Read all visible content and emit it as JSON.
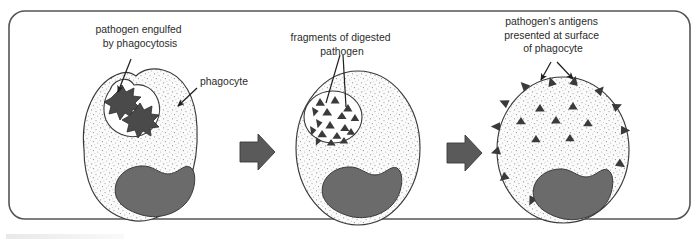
{
  "figure": {
    "title_alt": "Phagocytosis and antigen presentation by a phagocyte",
    "frame": {
      "border_color": "#555555",
      "background_color": "#ffffff",
      "corner_radius": 16
    },
    "colors": {
      "outline": "#3a3a3a",
      "cytoplasm_fill": "#fbfbfb",
      "stipple_dot": "#8f8f8f",
      "nucleus_fill": "#6b6b6b",
      "nucleus_stroke": "#3a3a3a",
      "pathogen_fill": "#4a4a4a",
      "antigen_fill": "#3a3a3a",
      "arrow_fill": "#5a5a5a",
      "leader_line": "#1f1f1f",
      "label_text": "#2b2b2b"
    },
    "labels": [
      {
        "id": "label-stage-1",
        "name": "pathogen-engulfed-label",
        "lines": [
          "pathogen engulfed",
          "by phagocytosis"
        ],
        "x": 140,
        "y": 33,
        "anchor": "middle"
      },
      {
        "id": "label-phagocyte",
        "name": "phagocyte-label",
        "lines": [
          "phagocyte"
        ],
        "x": 200,
        "y": 85,
        "anchor": "start"
      },
      {
        "id": "label-stage-2",
        "name": "fragments-of-digested-pathogen-label",
        "lines": [
          "fragments of digested",
          "pathogen"
        ],
        "x": 342,
        "y": 41,
        "anchor": "middle"
      },
      {
        "id": "label-stage-3",
        "name": "pathogens-antigens-label",
        "lines": [
          "pathogen's antigens",
          "presented at surface",
          "of phagocyte"
        ],
        "x": 553,
        "y": 25,
        "anchor": "middle"
      }
    ],
    "stages": [
      {
        "id": "stage-1",
        "name": "stage-engulfment",
        "caption": "pathogen engulfed by phagocytosis",
        "cell_center": [
          137,
          148
        ],
        "pathogen_count": 2,
        "pathogen_shape": "spiky-star",
        "vesicle": "open pseudopod pocket",
        "surface_antigens": 0
      },
      {
        "id": "stage-2",
        "name": "stage-digestion",
        "caption": "fragments of digested pathogen",
        "cell_center": [
          358,
          148
        ],
        "pathogen_count": 0,
        "fragment_shape": "triangle",
        "fragment_count": 17,
        "vesicle": "closed phagosome with fragments",
        "surface_antigens": 0
      },
      {
        "id": "stage-3",
        "name": "stage-antigen-presentation",
        "caption": "pathogen's antigens presented at surface of phagocyte",
        "cell_center": [
          563,
          150
        ],
        "internal_antigen_count": 7,
        "surface_antigen_count": 12,
        "antigen_shape": "triangle",
        "vesicle": "none"
      }
    ],
    "arrows": [
      {
        "id": "arrow-1",
        "name": "process-arrow-1",
        "x": 248,
        "y": 152,
        "direction": "right"
      },
      {
        "id": "arrow-2",
        "name": "process-arrow-2",
        "x": 455,
        "y": 153,
        "direction": "right"
      }
    ]
  }
}
